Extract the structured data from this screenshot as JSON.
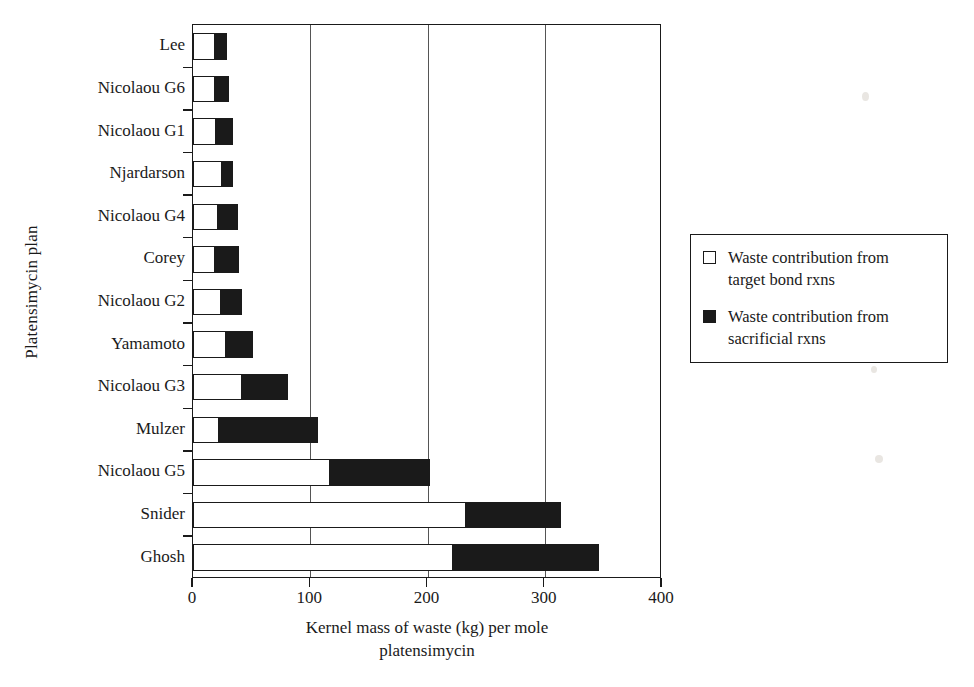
{
  "chart_data": {
    "type": "bar",
    "orientation": "horizontal",
    "stacked": true,
    "title": "",
    "xlabel": "Kernel mass of waste (kg) per mole platensimycin",
    "xlabel_line1": "Kernel mass of waste (kg) per mole",
    "xlabel_line2": "platensimycin",
    "ylabel": "Platensimycin plan",
    "xlim": [
      0,
      400
    ],
    "ylim_categories": 13,
    "xticks": [
      0,
      100,
      200,
      300,
      400
    ],
    "xtick_labels": [
      "0",
      "100",
      "200",
      "300",
      "400"
    ],
    "grid": "vertical-only",
    "legend_position": "right-outside",
    "categories": [
      "Lee",
      "Nicolaou G6",
      "Nicolaou G1",
      "Njardarson",
      "Nicolaou G4",
      "Corey",
      "Nicolaou G2",
      "Yamamoto",
      "Nicolaou G3",
      "Mulzer",
      "Nicolaou G5",
      "Snider",
      "Ghosh"
    ],
    "series": [
      {
        "name": "Waste contribution from target bond rxns",
        "color": "#ffffff",
        "edge_color": "#1a1a1a",
        "values": [
          19,
          19,
          20,
          25,
          21,
          19,
          24,
          28,
          42,
          22,
          117,
          233,
          222
        ]
      },
      {
        "name": "Waste contribution from sacrificial rxns",
        "color": "#1a1a1a",
        "edge_color": "#1a1a1a",
        "values": [
          10,
          12,
          14,
          9,
          17,
          20,
          18,
          23,
          39,
          85,
          85,
          81,
          124
        ]
      }
    ],
    "totals": [
      29,
      31,
      34,
      34,
      38,
      39,
      42,
      51,
      81,
      107,
      202,
      314,
      346
    ]
  },
  "legend": {
    "entries": [
      {
        "swatch": "hollow",
        "line1": "Waste contribution from",
        "line2": "target bond rxns"
      },
      {
        "swatch": "filled",
        "line1": "Waste contribution from",
        "line2": "sacrificial rxns"
      }
    ]
  },
  "colors": {
    "axis": "#1a1a1a",
    "grid": "#555555",
    "target_bond": "#ffffff",
    "sacrificial": "#1a1a1a",
    "background": "#ffffff"
  }
}
